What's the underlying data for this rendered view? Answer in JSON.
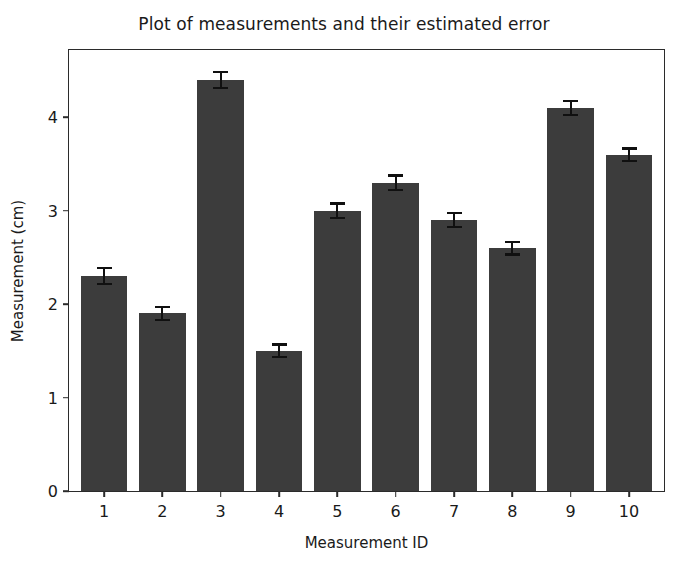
{
  "chart_data": {
    "type": "bar",
    "title": "Plot of measurements and their estimated error",
    "xlabel": "Measurement ID",
    "ylabel": "Measurement (cm)",
    "categories": [
      "1",
      "2",
      "3",
      "4",
      "5",
      "6",
      "7",
      "8",
      "9",
      "10"
    ],
    "values": [
      2.3,
      1.9,
      4.4,
      1.5,
      3.0,
      3.3,
      2.9,
      2.6,
      4.1,
      3.6
    ],
    "errors": [
      0.1,
      0.08,
      0.1,
      0.08,
      0.09,
      0.09,
      0.09,
      0.08,
      0.09,
      0.08
    ],
    "ylim": [
      0,
      4.72
    ],
    "xlim": [
      0.4,
      10.6
    ],
    "yticks": [
      0,
      1,
      2,
      3,
      4
    ],
    "ytick_labels": [
      "0",
      "1",
      "2",
      "3",
      "4"
    ],
    "grid": false,
    "legend": false,
    "bar_color": "#3c3c3c",
    "error_color": "#101010",
    "axes_color": "#2b2b2b",
    "background": "#ffffff"
  }
}
